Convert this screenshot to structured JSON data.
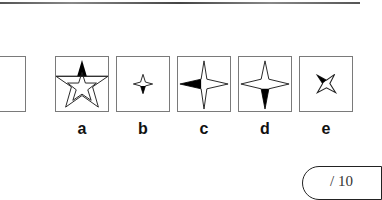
{
  "puzzle": {
    "question_box": {
      "visible": "partial",
      "content": ""
    },
    "options": [
      {
        "label": "a",
        "figure": "five-point star outline with black triangular spike above a horizontal divider line"
      },
      {
        "label": "b",
        "figure": "small four-point star, bottom point filled black"
      },
      {
        "label": "c",
        "figure": "large four-point star, left point filled black"
      },
      {
        "label": "d",
        "figure": "large four-point star, bottom point filled black"
      },
      {
        "label": "e",
        "figure": "small rotated four-point star, upper-left point filled black"
      }
    ]
  },
  "score": {
    "text": "/ 10"
  },
  "colors": {
    "border": "#7a7a7a",
    "fill": "#000000",
    "background": "#ffffff"
  }
}
